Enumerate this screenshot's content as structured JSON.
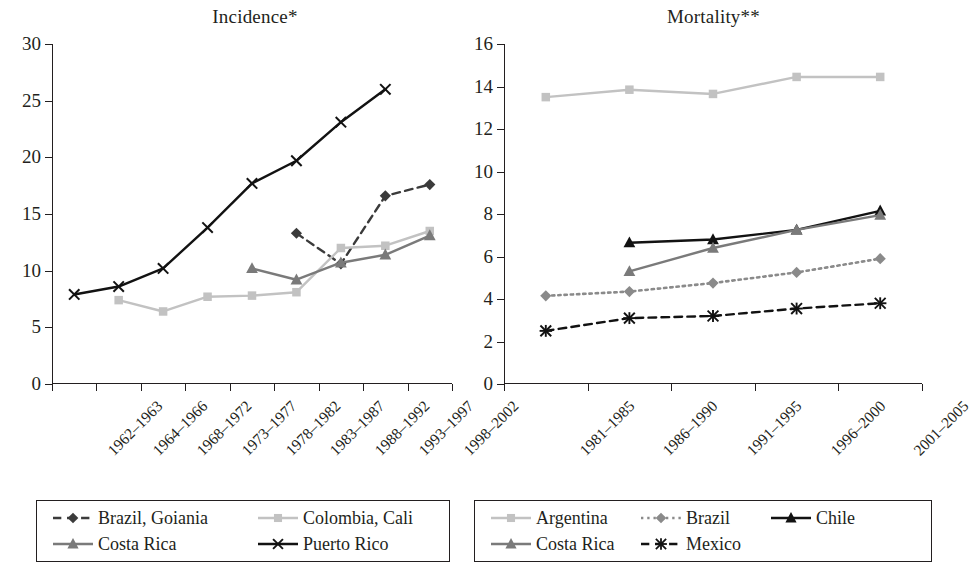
{
  "chart_data": [
    {
      "type": "line",
      "title": "Incidence*",
      "xlabel": "",
      "ylabel": "",
      "ylim": [
        0,
        30
      ],
      "yticks": [
        0,
        5,
        10,
        15,
        20,
        25,
        30
      ],
      "grid": false,
      "legend_position": "bottom",
      "categories": [
        "1962–1963",
        "1964–1966",
        "1968–1972",
        "1973–1977",
        "1978–1982",
        "1983–1987",
        "1988–1992",
        "1993–1997",
        "1998–2002"
      ],
      "series": [
        {
          "name": "Brazil, Goiania",
          "color": "#3b3b3b",
          "marker": "diamond",
          "line": "dashed",
          "values": [
            null,
            null,
            null,
            null,
            null,
            13.3,
            10.6,
            16.6,
            17.6
          ]
        },
        {
          "name": "Colombia, Cali",
          "color": "#c2c2c2",
          "marker": "square",
          "line": "solid",
          "values": [
            null,
            7.4,
            6.4,
            7.7,
            7.8,
            8.1,
            12.0,
            12.2,
            13.5
          ]
        },
        {
          "name": "Costa Rica",
          "color": "#7a7a7a",
          "marker": "triangle",
          "line": "solid",
          "values": [
            null,
            null,
            null,
            null,
            10.2,
            9.2,
            10.7,
            11.4,
            13.1
          ]
        },
        {
          "name": "Puerto Rico",
          "color": "#121212",
          "marker": "cross",
          "line": "solid",
          "values": [
            7.9,
            8.6,
            10.2,
            13.8,
            17.7,
            19.7,
            23.1,
            26.0,
            null
          ]
        }
      ]
    },
    {
      "type": "line",
      "title": "Mortality**",
      "xlabel": "",
      "ylabel": "",
      "ylim": [
        0,
        16
      ],
      "yticks": [
        0,
        2,
        4,
        6,
        8,
        10,
        12,
        14,
        16
      ],
      "grid": false,
      "legend_position": "bottom",
      "categories": [
        "1981–1985",
        "1986–1990",
        "1991–1995",
        "1996–2000",
        "2001–2005"
      ],
      "series": [
        {
          "name": "Argentina",
          "color": "#c2c2c2",
          "marker": "square",
          "line": "solid",
          "values": [
            13.5,
            13.85,
            13.65,
            14.45,
            14.45
          ]
        },
        {
          "name": "Brazil",
          "color": "#8a8a8a",
          "marker": "diamond",
          "line": "dotted",
          "values": [
            4.15,
            4.35,
            4.75,
            5.25,
            5.9
          ]
        },
        {
          "name": "Chile",
          "color": "#121212",
          "marker": "triangle",
          "line": "solid",
          "values": [
            null,
            6.65,
            6.8,
            7.25,
            8.15
          ]
        },
        {
          "name": "Costa Rica",
          "color": "#7a7a7a",
          "marker": "triangle",
          "line": "solid",
          "values": [
            null,
            5.3,
            6.4,
            7.25,
            7.95
          ]
        },
        {
          "name": "Mexico",
          "color": "#121212",
          "marker": "asterisk",
          "line": "dashed",
          "values": [
            2.5,
            3.1,
            3.2,
            3.55,
            3.8
          ]
        }
      ]
    }
  ],
  "panels": {
    "left": {
      "title": "Incidence*",
      "legend": [
        {
          "label": "Brazil, Goiania",
          "color": "#3b3b3b",
          "marker": "diamond",
          "line": "dashed"
        },
        {
          "label": "Colombia, Cali",
          "color": "#c2c2c2",
          "marker": "square",
          "line": "solid"
        },
        {
          "label": "Costa Rica",
          "color": "#7a7a7a",
          "marker": "triangle",
          "line": "solid"
        },
        {
          "label": "Puerto Rico",
          "color": "#121212",
          "marker": "cross",
          "line": "solid"
        }
      ]
    },
    "right": {
      "title": "Mortality**",
      "legend": [
        {
          "label": "Argentina",
          "color": "#c2c2c2",
          "marker": "square",
          "line": "solid"
        },
        {
          "label": "Brazil",
          "color": "#8a8a8a",
          "marker": "diamond",
          "line": "dotted"
        },
        {
          "label": "Chile",
          "color": "#121212",
          "marker": "triangle",
          "line": "solid"
        },
        {
          "label": "Costa Rica",
          "color": "#7a7a7a",
          "marker": "triangle",
          "line": "solid"
        },
        {
          "label": "Mexico",
          "color": "#121212",
          "marker": "asterisk",
          "line": "dashed"
        }
      ]
    }
  }
}
